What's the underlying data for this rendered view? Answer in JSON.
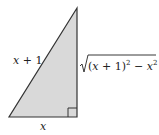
{
  "diagram": {
    "shape": "right-triangle",
    "fill_color": "#d9d9d9",
    "stroke_color": "#333333",
    "labels": {
      "hypotenuse": "x + 1",
      "base": "x",
      "height": "√((x + 1)² − x²)"
    },
    "height_parts": {
      "radical": "√",
      "open": "(",
      "var1": "x",
      "plus_one": " + 1)",
      "exp1": "2",
      "minus": " − ",
      "var2": "x",
      "exp2": "2"
    },
    "right_angle_marker": true
  }
}
